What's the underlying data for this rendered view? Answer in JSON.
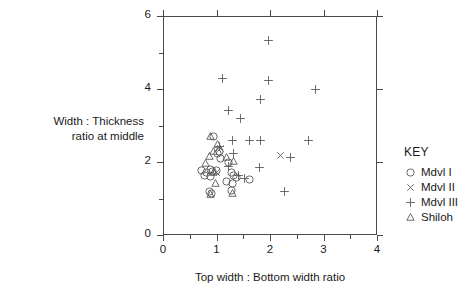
{
  "chart_data": {
    "type": "scatter",
    "title": "",
    "xlabel": "Top width : Bottom width ratio",
    "ylabel_lines": [
      "Width : Thickness",
      "ratio at middle"
    ],
    "ylabel": "Width : Thickness ratio at middle",
    "xlim": [
      0,
      4
    ],
    "ylim": [
      0,
      6
    ],
    "xticks": [
      0,
      1,
      2,
      3,
      4
    ],
    "xticklabels": [
      "0",
      "1",
      "2",
      "3",
      "4"
    ],
    "yticks": [
      0,
      2,
      4,
      6
    ],
    "yticklabels": [
      "0",
      "2",
      "4",
      "6"
    ],
    "x_minor_ticks": [
      0.5,
      1.5,
      2.5,
      3.5
    ],
    "y_minor_ticks": [
      1,
      3,
      5
    ],
    "grid": false,
    "legend_position": "right-outside",
    "legend_title": "KEY",
    "series": [
      {
        "name": "Mdvl I",
        "marker": "circle",
        "points": [
          [
            0.95,
            2.7
          ],
          [
            1.05,
            2.28
          ],
          [
            1.02,
            2.22
          ],
          [
            1.08,
            2.1
          ],
          [
            1.22,
            2.0
          ],
          [
            0.72,
            1.78
          ],
          [
            0.82,
            1.72
          ],
          [
            0.88,
            1.8
          ],
          [
            0.92,
            1.74
          ],
          [
            1.0,
            1.76
          ],
          [
            0.78,
            1.62
          ],
          [
            0.88,
            1.6
          ],
          [
            1.28,
            1.7
          ],
          [
            1.32,
            1.62
          ],
          [
            1.38,
            1.58
          ],
          [
            1.18,
            1.46
          ],
          [
            1.3,
            1.42
          ],
          [
            1.62,
            1.52
          ],
          [
            0.86,
            1.18
          ],
          [
            0.9,
            1.14
          ],
          [
            1.28,
            1.22
          ]
        ]
      },
      {
        "name": "Mdvl II",
        "marker": "cross-x",
        "points": [
          [
            1.07,
            2.38
          ],
          [
            1.0,
            1.7
          ],
          [
            2.2,
            2.18
          ]
        ]
      },
      {
        "name": "Mdvl III",
        "marker": "plus",
        "points": [
          [
            1.98,
            5.32
          ],
          [
            1.12,
            4.28
          ],
          [
            1.98,
            4.22
          ],
          [
            2.85,
            4.0
          ],
          [
            1.82,
            3.72
          ],
          [
            1.22,
            3.4
          ],
          [
            1.45,
            3.2
          ],
          [
            1.06,
            2.42
          ],
          [
            1.3,
            2.6
          ],
          [
            1.62,
            2.58
          ],
          [
            1.82,
            2.58
          ],
          [
            2.72,
            2.58
          ],
          [
            1.32,
            2.22
          ],
          [
            2.38,
            2.12
          ],
          [
            1.22,
            1.88
          ],
          [
            1.8,
            1.86
          ],
          [
            1.42,
            1.62
          ],
          [
            1.52,
            1.56
          ],
          [
            2.28,
            1.18
          ]
        ]
      },
      {
        "name": "Shiloh",
        "marker": "triangle",
        "points": [
          [
            0.88,
            2.7
          ],
          [
            1.02,
            2.48
          ],
          [
            0.95,
            2.3
          ],
          [
            0.86,
            2.16
          ],
          [
            1.18,
            2.12
          ],
          [
            0.8,
            1.96
          ],
          [
            0.94,
            1.72
          ],
          [
            0.98,
            1.42
          ],
          [
            0.88,
            1.12
          ],
          [
            1.3,
            1.14
          ],
          [
            1.32,
            2.02
          ]
        ]
      }
    ]
  },
  "legend": {
    "title": "KEY",
    "items": [
      {
        "label": "Mdvl I",
        "marker": "circle"
      },
      {
        "label": "Mdvl II",
        "marker": "cross-x"
      },
      {
        "label": "Mdvl III",
        "marker": "plus"
      },
      {
        "label": "Shiloh",
        "marker": "triangle"
      }
    ]
  },
  "colors": {
    "axis": "#4a4a4a",
    "marker": "#5a5a5a",
    "text": "#1a1a1a",
    "background": "#ffffff"
  }
}
